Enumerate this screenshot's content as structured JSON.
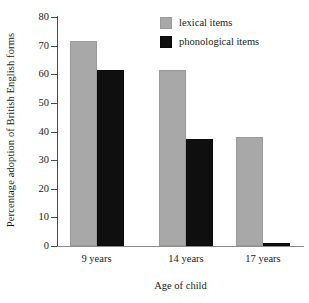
{
  "chart_data": {
    "type": "bar",
    "title": "",
    "xlabel": "Age of child",
    "ylabel": "Percentage adoption of British English forms",
    "categories": [
      "9 years",
      "14 years",
      "17 years"
    ],
    "series": [
      {
        "name": "lexical items",
        "color": "#a8a8a8",
        "values": [
          71.5,
          61.5,
          38
        ]
      },
      {
        "name": "phonological items",
        "color": "#0f0f0f",
        "values": [
          61.5,
          37.5,
          1
        ]
      }
    ],
    "ylim": [
      0,
      80
    ],
    "ytick_step": 10,
    "yticks": [
      "80",
      "70",
      "60",
      "50",
      "40",
      "30",
      "20",
      "10",
      "0"
    ],
    "grid": false,
    "legend_position": "top-right",
    "background": "#ffffff"
  },
  "legend": {
    "entries": [
      {
        "label": "lexical items",
        "swatch": "lexical"
      },
      {
        "label": "phonological items",
        "swatch": "phonological"
      }
    ]
  }
}
